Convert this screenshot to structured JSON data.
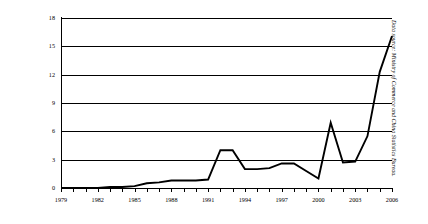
{
  "chart_data": {
    "type": "line",
    "title": "",
    "subtitle": "",
    "xlabel": "",
    "ylabel": "",
    "xlim": [
      1979,
      2006
    ],
    "ylim": [
      0,
      18
    ],
    "grid": true,
    "legend_position": "none",
    "y_ticks": [
      0,
      3,
      6,
      9,
      12,
      15,
      18
    ],
    "y_tick_labels": [
      "0",
      "3",
      "6",
      "9",
      "12",
      "15",
      "18"
    ],
    "x_ticks": [
      1979,
      1980,
      1981,
      1982,
      1983,
      1984,
      1985,
      1986,
      1987,
      1988,
      1989,
      1990,
      1991,
      1992,
      1993,
      1994,
      1995,
      1996,
      1997,
      1998,
      1999,
      2000,
      2001,
      2002,
      2003,
      2004,
      2005,
      2006
    ],
    "x_tick_labels": [
      "1979",
      "1982",
      "1985",
      "1988",
      "1991",
      "1994",
      "1997",
      "2000",
      "2003",
      "2006"
    ],
    "x_tick_labeled_years": [
      1979,
      1982,
      1985,
      1988,
      1991,
      1994,
      1997,
      2000,
      2003,
      2006
    ],
    "series": [
      {
        "name": "",
        "color": "#000000",
        "x": [
          1979,
          1980,
          1981,
          1982,
          1983,
          1984,
          1985,
          1986,
          1987,
          1988,
          1989,
          1990,
          1991,
          1992,
          1993,
          1994,
          1995,
          1996,
          1997,
          1998,
          1999,
          2000,
          2001,
          2002,
          2003,
          2004,
          2005,
          2006
        ],
        "values": [
          0.0,
          0.0,
          0.0,
          0.0,
          0.1,
          0.1,
          0.2,
          0.5,
          0.6,
          0.8,
          0.8,
          0.8,
          0.9,
          4.0,
          4.0,
          2.0,
          2.0,
          2.1,
          2.6,
          2.6,
          1.8,
          1.0,
          6.9,
          2.7,
          2.8,
          5.5,
          12.3,
          16.1
        ]
      }
    ],
    "annotations": [
      "Data source: Ministry of Commerce and China Statistics Bureau."
    ]
  },
  "source_note": "Data source: Ministry of Commerce and China Statistics Bureau."
}
